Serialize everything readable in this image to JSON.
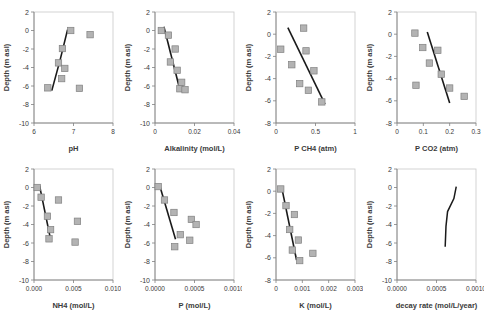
{
  "figure": {
    "panel_count": 8,
    "marker_color": "#b3b3b3",
    "marker_edge": "#808080",
    "trend_color": "#1a1a1a",
    "axis_color": "#808080",
    "grid": false
  },
  "chart_data": [
    {
      "type": "scatter",
      "title": "",
      "xlabel": "pH",
      "ylabel": "Depth (m asl)",
      "xlim": [
        6,
        8
      ],
      "ylim": [
        -10,
        2
      ],
      "xticks": [
        6,
        7,
        8
      ],
      "yticks": [
        -10,
        -8,
        -6,
        -4,
        -2,
        0,
        2
      ],
      "points": [
        {
          "x": 6.93,
          "y": 0.0
        },
        {
          "x": 7.42,
          "y": -0.45
        },
        {
          "x": 6.72,
          "y": -1.95
        },
        {
          "x": 6.62,
          "y": -3.5
        },
        {
          "x": 6.78,
          "y": -4.1
        },
        {
          "x": 6.7,
          "y": -5.2
        },
        {
          "x": 6.35,
          "y": -6.2
        },
        {
          "x": 7.15,
          "y": -6.25
        }
      ],
      "trend": [
        {
          "x": 6.85,
          "y": 0.1
        },
        {
          "x": 6.66,
          "y": -3.2
        },
        {
          "x": 6.45,
          "y": -6.5
        }
      ]
    },
    {
      "type": "scatter",
      "title": "",
      "xlabel": "Alkalinity (mol/L)",
      "ylabel": "Depth (m asl)",
      "xlim": [
        0,
        0.04
      ],
      "ylim": [
        -10,
        2
      ],
      "xticks": [
        0,
        0.02,
        0.04
      ],
      "yticks": [
        -10,
        -8,
        -6,
        -4,
        -2,
        0,
        2
      ],
      "points": [
        {
          "x": 0.0032,
          "y": 0.0
        },
        {
          "x": 0.0068,
          "y": -0.5
        },
        {
          "x": 0.0102,
          "y": -2.0
        },
        {
          "x": 0.0078,
          "y": -3.4
        },
        {
          "x": 0.0112,
          "y": -4.3
        },
        {
          "x": 0.0135,
          "y": -5.6
        },
        {
          "x": 0.0126,
          "y": -6.3
        },
        {
          "x": 0.0152,
          "y": -6.4
        }
      ],
      "trend": [
        {
          "x": 0.0045,
          "y": 0.4
        },
        {
          "x": 0.0126,
          "y": -6.4
        }
      ]
    },
    {
      "type": "scatter",
      "title": "",
      "xlabel": "P CH4 (atm)",
      "ylabel": "Depth (m asl)",
      "xlim": [
        0,
        1
      ],
      "ylim": [
        -8,
        2
      ],
      "xticks": [
        0,
        0.5,
        1
      ],
      "yticks": [
        -8,
        -6,
        -4,
        -2,
        0,
        2
      ],
      "points": [
        {
          "x": 0.35,
          "y": 0.55
        },
        {
          "x": 0.06,
          "y": -1.35
        },
        {
          "x": 0.38,
          "y": -1.5
        },
        {
          "x": 0.2,
          "y": -2.75
        },
        {
          "x": 0.48,
          "y": -3.3
        },
        {
          "x": 0.3,
          "y": -4.45
        },
        {
          "x": 0.41,
          "y": -5.05
        },
        {
          "x": 0.58,
          "y": -6.1
        }
      ],
      "trend": [
        {
          "x": 0.15,
          "y": 0.6
        },
        {
          "x": 0.62,
          "y": -6.3
        }
      ]
    },
    {
      "type": "scatter",
      "title": "",
      "xlabel": "P CO2 (atm)",
      "ylabel": "Depth (m asl)",
      "xlim": [
        0,
        0.3
      ],
      "ylim": [
        -8,
        2
      ],
      "xticks": [
        0,
        0.1,
        0.2,
        0.3
      ],
      "yticks": [
        -8,
        -6,
        -4,
        -2,
        0,
        2
      ],
      "points": [
        {
          "x": 0.068,
          "y": 0.1
        },
        {
          "x": 0.098,
          "y": -1.2
        },
        {
          "x": 0.155,
          "y": -1.45
        },
        {
          "x": 0.123,
          "y": -2.6
        },
        {
          "x": 0.168,
          "y": -3.6
        },
        {
          "x": 0.072,
          "y": -4.6
        },
        {
          "x": 0.2,
          "y": -4.85
        },
        {
          "x": 0.255,
          "y": -5.6
        }
      ],
      "trend": [
        {
          "x": 0.115,
          "y": 0.2
        },
        {
          "x": 0.2,
          "y": -6.2
        }
      ]
    },
    {
      "type": "scatter",
      "title": "",
      "xlabel": "NH4 (mol/L)",
      "ylabel": "Depth (m asl)",
      "xlim": [
        0,
        0.01
      ],
      "ylim": [
        -10,
        2
      ],
      "xticks": [
        0.0,
        0.005,
        0.01
      ],
      "xticklabels": [
        "0.000",
        "0.005",
        "0.010"
      ],
      "yticks": [
        -10,
        -8,
        -6,
        -4,
        -2,
        0,
        2
      ],
      "points": [
        {
          "x": 0.0004,
          "y": 0.0
        },
        {
          "x": 0.0009,
          "y": -1.05
        },
        {
          "x": 0.0031,
          "y": -1.35
        },
        {
          "x": 0.0017,
          "y": -3.1
        },
        {
          "x": 0.0055,
          "y": -3.65
        },
        {
          "x": 0.0021,
          "y": -4.55
        },
        {
          "x": 0.0019,
          "y": -5.55
        },
        {
          "x": 0.0052,
          "y": -5.9
        }
      ],
      "trend": [
        {
          "x": 0.0007,
          "y": 0.2
        },
        {
          "x": 0.0021,
          "y": -5.6
        }
      ]
    },
    {
      "type": "scatter",
      "title": "",
      "xlabel": "P (mol/L)",
      "ylabel": "Depth (m asl)",
      "xlim": [
        0,
        0.001
      ],
      "ylim": [
        -10,
        2
      ],
      "xticks": [
        0.0,
        0.0005,
        0.001
      ],
      "xticklabels": [
        "0.0000",
        "0.0005",
        "0.0010"
      ],
      "yticks": [
        -10,
        -8,
        -6,
        -4,
        -2,
        0,
        2
      ],
      "points": [
        {
          "x": 4e-05,
          "y": 0.1
        },
        {
          "x": 0.00012,
          "y": -1.35
        },
        {
          "x": 0.00024,
          "y": -2.7
        },
        {
          "x": 0.00046,
          "y": -3.45
        },
        {
          "x": 0.00052,
          "y": -4.0
        },
        {
          "x": 0.00032,
          "y": -5.1
        },
        {
          "x": 0.00044,
          "y": -5.7
        },
        {
          "x": 0.00025,
          "y": -6.4
        }
      ],
      "trend": [
        {
          "x": 6e-05,
          "y": 0.2
        },
        {
          "x": 0.00026,
          "y": -5.6
        }
      ]
    },
    {
      "type": "scatter",
      "title": "",
      "xlabel": "K (mol/L)",
      "ylabel": "Depth (m asl)",
      "xlim": [
        0,
        0.003
      ],
      "ylim": [
        -8,
        2
      ],
      "xticks": [
        0,
        0.001,
        0.002,
        0.003
      ],
      "yticks": [
        -8,
        -6,
        -4,
        -2,
        0,
        2
      ],
      "points": [
        {
          "x": 0.00018,
          "y": 0.2
        },
        {
          "x": 0.00038,
          "y": -1.3
        },
        {
          "x": 0.0007,
          "y": -2.1
        },
        {
          "x": 0.00052,
          "y": -3.45
        },
        {
          "x": 0.00085,
          "y": -4.4
        },
        {
          "x": 0.00062,
          "y": -5.3
        },
        {
          "x": 0.0014,
          "y": -5.6
        },
        {
          "x": 0.0009,
          "y": -6.25
        }
      ],
      "trend": [
        {
          "x": 0.00022,
          "y": 0.3
        },
        {
          "x": 0.00078,
          "y": -6.2
        }
      ]
    },
    {
      "type": "line",
      "title": "",
      "xlabel": "decay rate (mol/L/year)",
      "ylabel": "Depth (m asl)",
      "xlim": [
        0,
        0.001
      ],
      "ylim": [
        -10,
        2
      ],
      "xticks": [
        0.0,
        0.0005,
        0.001
      ],
      "xticklabels": [
        "0.0000",
        "0.0005",
        "0.0010"
      ],
      "yticks": [
        -10,
        -8,
        -6,
        -4,
        -2,
        0,
        2
      ],
      "points": [],
      "line": [
        {
          "x": 0.00075,
          "y": 0.1
        },
        {
          "x": 0.00072,
          "y": -1.2
        },
        {
          "x": 0.00064,
          "y": -2.6
        },
        {
          "x": 0.00062,
          "y": -4.2
        },
        {
          "x": 0.00061,
          "y": -6.4
        }
      ]
    }
  ]
}
